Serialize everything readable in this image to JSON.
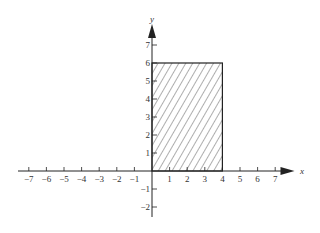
{
  "chart_data": {
    "type": "diagram",
    "title": "",
    "xlabel": "x",
    "ylabel": "y",
    "x_ticks": [
      -7,
      -6,
      -5,
      -4,
      -3,
      -2,
      -1,
      1,
      2,
      3,
      4,
      5,
      6,
      7
    ],
    "y_ticks": [
      -2,
      -1,
      1,
      2,
      3,
      4,
      5,
      6,
      7
    ],
    "xlim": [
      -7.3,
      8.5
    ],
    "ylim": [
      -2.5,
      8.0
    ],
    "shaded_region": {
      "x": [
        0,
        4
      ],
      "y": [
        0,
        6
      ],
      "fill": "diagonal-hatch"
    },
    "grid": false
  },
  "labels": {
    "x_axis": "x",
    "y_axis": "y"
  },
  "colors": {
    "ink": "#222222",
    "background": "#ffffff"
  }
}
